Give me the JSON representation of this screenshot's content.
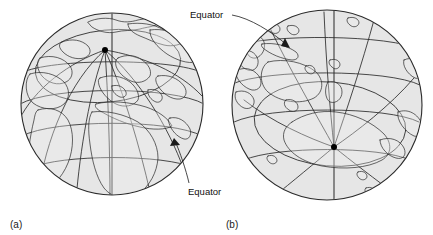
{
  "figure": {
    "kind": "two-globe-orthographic-diagram",
    "background_color": "#ffffff",
    "ink_color": "#262626",
    "globe_fill_color": "#e6e6e6"
  },
  "panels": [
    {
      "id": "a",
      "caption": "(a)",
      "caption_x": 16,
      "caption_y": 224,
      "view": "north-polar-oblique",
      "pole_marker": "north-pole-dot",
      "pole_dot": {
        "cx": 105,
        "cy": 50,
        "r": 3.0
      },
      "disc": {
        "cx": 112,
        "cy": 104,
        "r": 91
      },
      "annotation": {
        "label": "Equator",
        "label_x": 192,
        "label_y": 191,
        "leader_from": {
          "x": 188,
          "y": 184
        },
        "leader_to": {
          "x": 174,
          "y": 139
        },
        "arrow_at": {
          "x": 174,
          "y": 139
        }
      }
    },
    {
      "id": "b",
      "caption": "(b)",
      "caption_x": 230,
      "caption_y": 224,
      "view": "south-polar-oblique",
      "pole_marker": "south-pole-dot",
      "pole_dot": {
        "cx": 334,
        "cy": 147,
        "r": 3.0
      },
      "disc": {
        "cx": 327,
        "cy": 105,
        "r": 95
      },
      "annotation": {
        "label": "Equator",
        "label_x": 191,
        "label_y": 18,
        "leader_from": {
          "x": 231,
          "y": 15
        },
        "leader_to": {
          "x": 288,
          "y": 46
        },
        "arrow_at": {
          "x": 288,
          "y": 46
        }
      }
    }
  ],
  "labels": {
    "equator_a": "Equator",
    "equator_b": "Equator",
    "caption_a": "(a)",
    "caption_b": "(b)"
  }
}
